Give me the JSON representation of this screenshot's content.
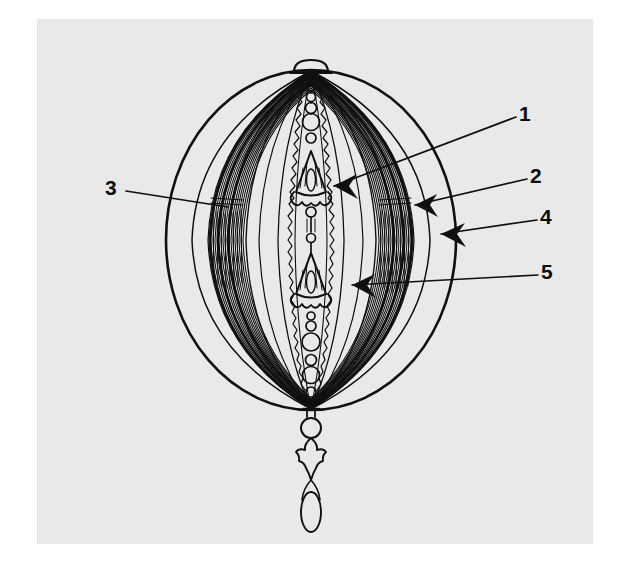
{
  "figure": {
    "kind": "line-drawing",
    "background_color": "#e9e9e9",
    "page_color": "#ffffff",
    "ink_color": "#101010",
    "callouts": [
      {
        "id": "1",
        "label": "1",
        "label_x": 519,
        "label_y": 103,
        "leader_from_x": 516,
        "leader_from_y": 117,
        "leader_to_x": 334,
        "leader_to_y": 186,
        "arrowhead": true
      },
      {
        "id": "2",
        "label": "2",
        "label_x": 530,
        "label_y": 165,
        "leader_from_x": 527,
        "leader_from_y": 179,
        "leader_to_x": 415,
        "leader_to_y": 205,
        "arrowhead": true
      },
      {
        "id": "3",
        "label": "3",
        "label_x": 105,
        "label_y": 177,
        "leader_from_x": 126,
        "leader_from_y": 191,
        "leader_to_x": 228,
        "leader_to_y": 207,
        "arrowhead": false
      },
      {
        "id": "4",
        "label": "4",
        "label_x": 540,
        "label_y": 206,
        "leader_from_x": 537,
        "leader_from_y": 220,
        "leader_to_x": 441,
        "leader_to_y": 234,
        "arrowhead": true
      },
      {
        "id": "5",
        "label": "5",
        "label_x": 541,
        "label_y": 261,
        "leader_from_x": 538,
        "leader_from_y": 275,
        "leader_to_x": 352,
        "leader_to_y": 285,
        "arrowhead": true
      }
    ],
    "sphere": {
      "center_x": 311,
      "center_y": 240,
      "radius_x": 145,
      "radius_y": 170
    },
    "top_finial": "small dome loop",
    "bottom_finial": "bead, pointed diamond, elongated oval drop",
    "shaded_bands": 2,
    "bead_chain_segments": 2,
    "tassel_ornaments": 2
  }
}
